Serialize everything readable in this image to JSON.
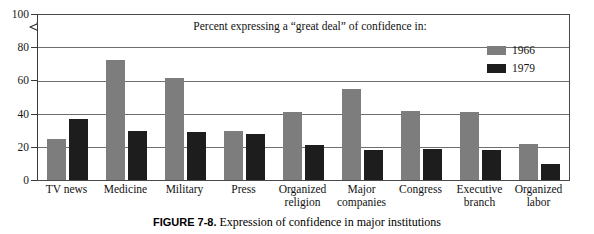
{
  "figure": {
    "caption_number": "FIGURE 7-8.",
    "caption_text": "Expression of confidence in major institutions"
  },
  "legend": {
    "position": "top-right",
    "entries": [
      {
        "label": "1966",
        "color": "#7d7d7d",
        "swatch_name": "legend-swatch-1966"
      },
      {
        "label": "1979",
        "color": "#1d1d1d",
        "swatch_name": "legend-swatch-1979"
      }
    ]
  },
  "axis": {
    "y_ticks": [
      "0",
      "20",
      "40",
      "60",
      "80",
      "100"
    ],
    "break_between": [
      "80",
      "100"
    ],
    "has_axis_break": true
  },
  "chart_data": {
    "type": "bar",
    "title": "Percent expressing a “great deal” of confidence in:",
    "xlabel": "",
    "ylabel": "",
    "ylim": [
      0,
      100
    ],
    "yticks": [
      0,
      20,
      40,
      60,
      80,
      100
    ],
    "grid": true,
    "legend_position": "top-right",
    "axis_break": {
      "from": 80,
      "to": 100
    },
    "categories": [
      "TV news",
      "Medicine",
      "Military",
      "Press",
      "Organized religion",
      "Major companies",
      "Congress",
      "Executive branch",
      "Organized labor"
    ],
    "category_lines": [
      [
        "TV news",
        ""
      ],
      [
        "Medicine",
        ""
      ],
      [
        "Military",
        ""
      ],
      [
        "Press",
        ""
      ],
      [
        "Organized",
        "religion"
      ],
      [
        "Major",
        "companies"
      ],
      [
        "Congress",
        ""
      ],
      [
        "Executive",
        "branch"
      ],
      [
        "Organized",
        "labor"
      ]
    ],
    "series": [
      {
        "name": "1966",
        "color": "#7d7d7d",
        "values": [
          25,
          73,
          62,
          30,
          41,
          55,
          42,
          41,
          22
        ]
      },
      {
        "name": "1979",
        "color": "#1d1d1d",
        "values": [
          37,
          30,
          29,
          28,
          21,
          18,
          19,
          18,
          10
        ]
      }
    ]
  }
}
